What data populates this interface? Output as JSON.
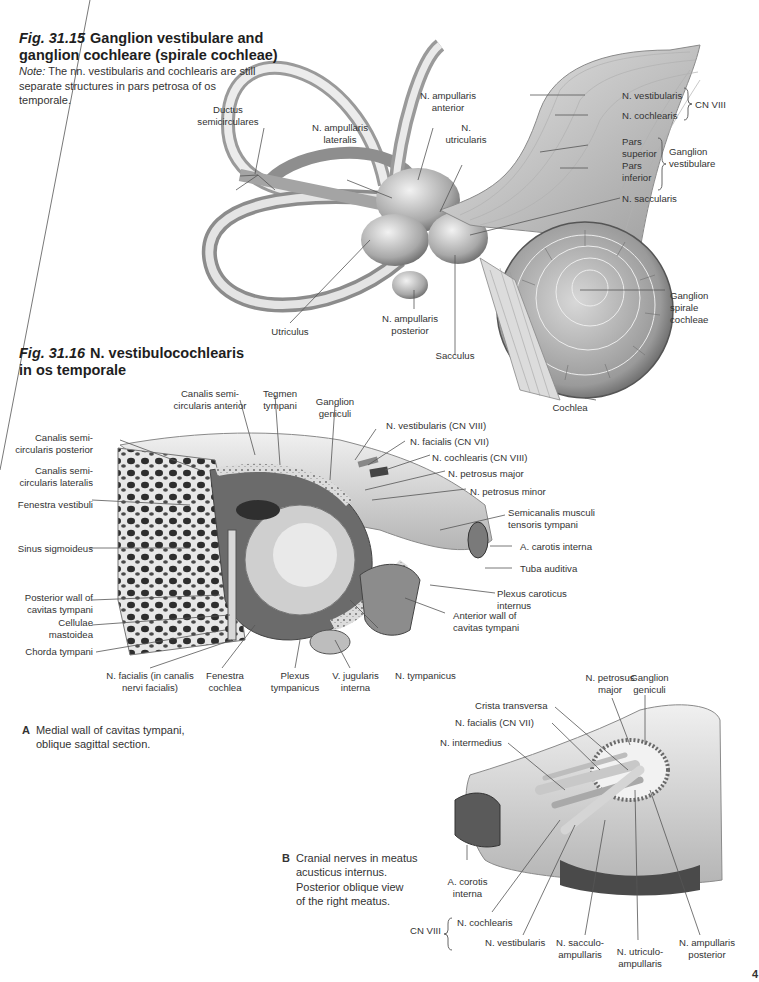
{
  "figure_31_15": {
    "number": "Fig. 31.15",
    "title": "Ganglion vestibulare and ganglion cochleare (spirale cochleae)",
    "note_label": "Note:",
    "note_text": "The nn. vestibularis and cochlearis are still separate structures in pars petrosa of os temporale.",
    "labels": {
      "ductus_semicirculares": "Ductus\nsemicirculares",
      "n_ampullaris_anterior": "N. ampullaris\nanterior",
      "n_ampullaris_lateralis": "N. ampullaris\nlateralis",
      "n_utricularis": "N.\nutricularis",
      "n_vestibularis": "N. vestibularis",
      "n_cochlearis": "N. cochlearis",
      "cn_viii": "CN VIII",
      "pars_superior": "Pars\nsuperior",
      "pars_inferior": "Pars\ninferior",
      "ganglion_vestibulare": "Ganglion\nvestibulare",
      "n_saccularis": "N. saccularis",
      "ganglion_spirale_cochleae": "Ganglion\nspirale\ncochleae",
      "utriculus": "Utriculus",
      "n_ampullaris_posterior": "N. ampullaris\nposterior",
      "sacculus": "Sacculus",
      "cochlea": "Cochlea"
    }
  },
  "figure_31_16": {
    "number": "Fig. 31.16",
    "title": "N. vestibulocochlearis in os temporale",
    "panel_a": {
      "letter": "A",
      "caption": "Medial wall of cavitas tympani,\noblique sagittal section.",
      "labels": {
        "canalis_semicircularis_anterior": "Canalis semi-\ncircularis anterior",
        "tegmen_tympani": "Tegmen\ntympani",
        "ganglion_geniculi": "Ganglion\ngeniculi",
        "n_vestibularis": "N. vestibularis (CN VIII)",
        "n_facialis": "N. facialis (CN VII)",
        "n_cochlearis": "N. cochlearis (CN VIII)",
        "n_petrosus_major": "N. petrosus major",
        "n_petrosus_minor": "N. petrosus minor",
        "semicanalis": "Semicanalis musculi\ntensoris tympani",
        "a_carotis_interna": "A. carotis interna",
        "tuba_auditiva": "Tuba auditiva",
        "plexus_caroticus_internus": "Plexus caroticus\ninternus",
        "anterior_wall": "Anterior wall of\ncavitas tympani",
        "canalis_semicircularis_posterior": "Canalis semi-\ncircularis posterior",
        "canalis_semicircularis_lateralis": "Canalis semi-\ncircularis lateralis",
        "fenestra_vestibuli": "Fenestra vestibuli",
        "sinus_sigmoideus": "Sinus sigmoideus",
        "posterior_wall": "Posterior wall of\ncavitas tympani",
        "cellulae_mastoidea": "Cellulae\nmastoidea",
        "chorda_tympani": "Chorda tympani",
        "n_facialis_canalis": "N. facialis (in canalis\nnervi facialis)",
        "fenestra_cochlea": "Fenestra\ncochlea",
        "plexus_tympanicus": "Plexus\ntympanicus",
        "v_jugularis_interna": "V. jugularis\ninterna",
        "n_tympanicus": "N. tympanicus"
      }
    },
    "panel_b": {
      "letter": "B",
      "caption": "Cranial nerves in meatus\nacusticus internus.\nPosterior oblique view\nof the right meatus.",
      "labels": {
        "n_petrosus_major": "N. petrosus\nmajor",
        "ganglion_geniculi": "Ganglion\ngeniculi",
        "crista_transversa": "Crista transversa",
        "n_facialis": "N. facialis (CN VII)",
        "n_intermedius": "N. intermedius",
        "a_carotis_interna": "A. corotis\ninterna",
        "cn_viii": "CN VIII",
        "n_cochlearis": "N. cochlearis",
        "n_vestibularis": "N. vestibularis",
        "n_sacculoampullaris": "N. sacculo-\nampullaris",
        "n_utriculoampullaris": "N. utriculo-\nampullaris",
        "n_ampullaris_posterior": "N. ampullaris\nposterior"
      }
    }
  },
  "page": {
    "number_fragment": "4"
  }
}
